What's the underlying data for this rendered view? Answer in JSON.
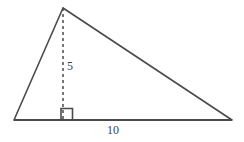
{
  "figure": {
    "type": "geometry-diagram",
    "shape": "triangle",
    "background_color": "#ffffff",
    "stroke_color": "#4a4a4a",
    "text_color": "#3f3f3f",
    "vertices": {
      "left": {
        "x": 14,
        "y": 120
      },
      "apex": {
        "x": 63,
        "y": 8
      },
      "right": {
        "x": 232,
        "y": 120
      }
    },
    "edges": [
      {
        "name": "base",
        "from": "left",
        "to": "right",
        "style": "solid"
      },
      {
        "name": "left-side",
        "from": "left",
        "to": "apex",
        "style": "solid"
      },
      {
        "name": "hypotenuse",
        "from": "apex",
        "to": "right",
        "style": "solid"
      }
    ],
    "altitude": {
      "style": "dashed",
      "from": {
        "x": 63,
        "y": 8
      },
      "to": {
        "x": 63,
        "y": 120
      },
      "dash_pattern": "3,3"
    },
    "right_angle_marker": {
      "x": 61,
      "y": 108,
      "size": 11
    },
    "labels": {
      "height": "5",
      "base": "10"
    },
    "label_positions": {
      "height": {
        "x": 67,
        "y": 70
      },
      "base": {
        "x": 113,
        "y": 134
      }
    }
  }
}
